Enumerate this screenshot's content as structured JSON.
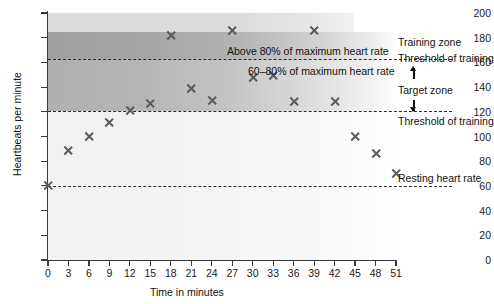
{
  "chart_data": {
    "type": "scatter",
    "title": "",
    "xlabel": "Time in minutes",
    "ylabel": "Heartbeats per minute",
    "xlim": [
      0,
      51
    ],
    "ylim": [
      0,
      200
    ],
    "grid": false,
    "legend_position": "right",
    "x_ticks": [
      0,
      3,
      6,
      9,
      12,
      15,
      18,
      21,
      24,
      27,
      30,
      33,
      36,
      39,
      42,
      45,
      48,
      51
    ],
    "y_ticks": [
      0,
      20,
      40,
      60,
      80,
      100,
      120,
      140,
      160,
      180,
      200
    ],
    "x": [
      0,
      3,
      6,
      9,
      12,
      15,
      18,
      21,
      24,
      27,
      30,
      33,
      36,
      39,
      42,
      45,
      48,
      51
    ],
    "values": [
      60,
      89,
      100,
      111,
      121,
      127,
      182,
      139,
      129,
      186,
      148,
      149,
      128,
      186,
      128,
      100,
      86,
      70
    ],
    "series": [
      {
        "name": "Heart rate",
        "marker": "cross",
        "values": [
          60,
          89,
          100,
          111,
          121,
          127,
          182,
          139,
          129,
          186,
          148,
          149,
          128,
          186,
          128,
          100,
          86,
          70
        ]
      }
    ],
    "reference_lines": [
      {
        "id": "upper-threshold",
        "value": 163,
        "style": "dashed",
        "label": "Threshold of training"
      },
      {
        "id": "lower-threshold",
        "value": 121,
        "style": "dashed",
        "label": "Threshold of training"
      },
      {
        "id": "resting-rate",
        "value": 60,
        "style": "dashed",
        "label": "Resting heart rate"
      }
    ],
    "bands": [
      {
        "id": "above-80",
        "from": 163,
        "to": 185,
        "label": "Above 80% of maximum heart rate",
        "shade": "dark"
      },
      {
        "id": "target-60-80",
        "from": 121,
        "to": 163,
        "label": "60–80% of maximum heart rate",
        "shade": "medium"
      }
    ],
    "annotations": [
      {
        "id": "label-above-80",
        "text": "Above 80% of maximum heart rate"
      },
      {
        "id": "label-60-80",
        "text": "60–80% of maximum heart rate"
      }
    ]
  },
  "axes": {
    "y_title": "Heartbeats per minute",
    "x_title": "Time in minutes",
    "y_tick_labels": [
      "200",
      "180",
      "160",
      "140",
      "120",
      "100",
      "80",
      "60",
      "40",
      "20",
      "0"
    ],
    "x_tick_labels": [
      "0",
      "3",
      "6",
      "9",
      "12",
      "15",
      "18",
      "21",
      "24",
      "27",
      "30",
      "33",
      "36",
      "39",
      "42",
      "45",
      "48",
      "51"
    ]
  },
  "in_chart_labels": {
    "above_80": "Above 80% of maximum heart rate",
    "target_60_80": "60–80% of maximum heart rate"
  },
  "side_labels": {
    "training_zone": "Training zone",
    "threshold_upper": "Threshold of training",
    "target_zone": "Target zone",
    "threshold_lower": "Threshold of training",
    "resting_heart_rate": "Resting heart rate"
  },
  "colors": {
    "marker": "#5c5c5c",
    "axis": "#3a3a3a",
    "dashed_line": "#2b2b2b",
    "band_above_80": "#a0a0a0",
    "band_target": "#b0b0b0",
    "band_below": "#f1f1f1",
    "band_top_strip": "#dcdcdc",
    "text": "#111111",
    "background": "#ffffff"
  }
}
